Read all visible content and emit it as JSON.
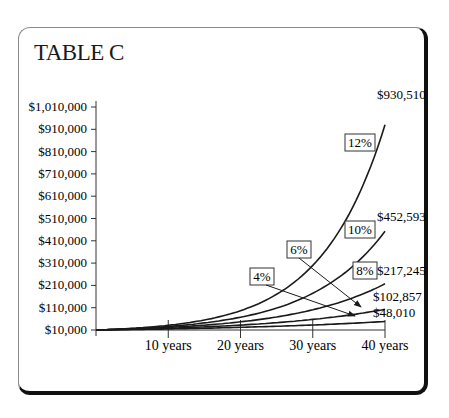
{
  "title": "TABLE C",
  "chart_data": {
    "type": "line",
    "title": "TABLE C",
    "xlabel": "",
    "ylabel": "",
    "x_ticks": [
      "10 years",
      "20 years",
      "30 years",
      "40 years"
    ],
    "x_tick_years": [
      10,
      20,
      30,
      40
    ],
    "y_ticks": [
      "$10,000",
      "$110,000",
      "$210,000",
      "$310,000",
      "$410,000",
      "$510,000",
      "$610,000",
      "$710,000",
      "$810,000",
      "$910,000",
      "$1,010,000"
    ],
    "y_tick_values": [
      10000,
      110000,
      210000,
      310000,
      410000,
      510000,
      610000,
      710000,
      810000,
      910000,
      1010000
    ],
    "xlim": [
      0,
      40
    ],
    "ylim": [
      10000,
      1010000
    ],
    "grid": false,
    "initial_investment": 10000,
    "series": [
      {
        "name": "12%",
        "rate": 0.12,
        "final_value": 930510,
        "final_label": "$930,510"
      },
      {
        "name": "10%",
        "rate": 0.1,
        "final_value": 452593,
        "final_label": "$452,593"
      },
      {
        "name": "8%",
        "rate": 0.08,
        "final_value": 217245,
        "final_label": "$217,245"
      },
      {
        "name": "6%",
        "rate": 0.06,
        "final_value": 102857,
        "final_label": "$102,857"
      },
      {
        "name": "4%",
        "rate": 0.04,
        "final_value": 48010,
        "final_label": "$48,010"
      }
    ],
    "annotations": [
      {
        "text": "12%",
        "type": "boxed-label"
      },
      {
        "text": "10%",
        "type": "boxed-label"
      },
      {
        "text": "8%",
        "type": "boxed-label"
      },
      {
        "text": "6%",
        "type": "boxed-label-with-arrow"
      },
      {
        "text": "4%",
        "type": "boxed-label-with-arrow"
      }
    ]
  }
}
